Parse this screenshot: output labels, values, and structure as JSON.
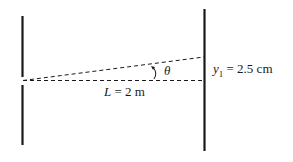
{
  "diagram": {
    "type": "double-slit geometry",
    "distance_label": {
      "var": "L",
      "text": " = 2 m"
    },
    "angle_label": "θ",
    "y_label": {
      "var": "y",
      "sub": "1",
      "text": " = 2.5 cm"
    },
    "colors": {
      "line": "#1a1a1a",
      "background": "#ffffff"
    }
  }
}
